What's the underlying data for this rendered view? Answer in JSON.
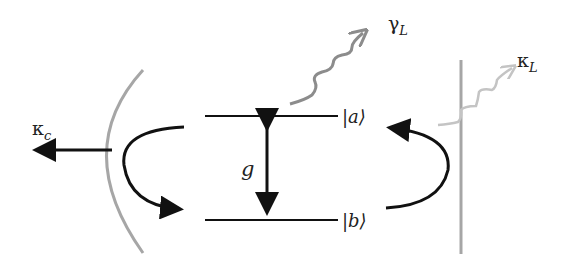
{
  "diagram": {
    "labels": {
      "kappa_c": "κ",
      "kappa_c_sub": "c",
      "gamma_L": "γ",
      "gamma_L_sub": "L",
      "kappa_L": "κ",
      "kappa_L_sub": "L",
      "g": "g",
      "state_a": "|a⟩",
      "state_b": "|b⟩"
    },
    "colors": {
      "black": "#111111",
      "gray_mirror": "#a6a6a6",
      "gray_wave": "#8c8c8c",
      "light_wave": "#c4c4c4"
    }
  }
}
